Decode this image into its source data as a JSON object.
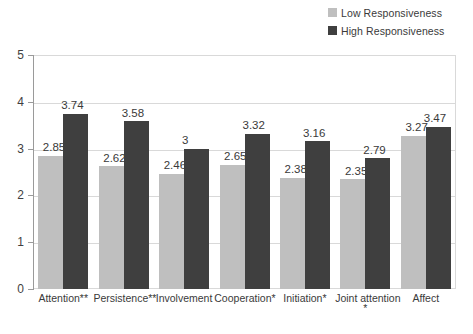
{
  "chart_data": {
    "type": "bar",
    "title": "",
    "xlabel": "",
    "ylabel": "",
    "ylim": [
      0,
      5
    ],
    "yticks": [
      0,
      1,
      2,
      3,
      4,
      5
    ],
    "grid": true,
    "legend_position": "top-right",
    "categories": [
      "Attention**",
      "Persistence**",
      "Involvement",
      "Cooperation*",
      "Initiation*",
      "Joint attention",
      "Affect"
    ],
    "category_sub_marks": [
      "",
      "",
      "",
      "",
      "",
      "*",
      ""
    ],
    "series": [
      {
        "name": "Low Responsiveness",
        "color": "#bfbfbf",
        "values": [
          2.85,
          2.62,
          2.46,
          2.65,
          2.38,
          2.35,
          3.27
        ],
        "labels": [
          "2.85",
          "2.62",
          "2.46",
          "2.65",
          "2.38",
          "2.35",
          "3.27"
        ]
      },
      {
        "name": "High Responsiveness",
        "color": "#3f3f3f",
        "values": [
          3.74,
          3.58,
          3.0,
          3.32,
          3.16,
          2.79,
          3.47
        ],
        "labels": [
          "3.74",
          "3.58",
          "3",
          "3.32",
          "3.16",
          "2.79",
          "3.47"
        ]
      }
    ]
  },
  "legend": {
    "items": [
      {
        "label": "Low Responsiveness",
        "color": "#bfbfbf"
      },
      {
        "label": "High Responsiveness",
        "color": "#3f3f3f"
      }
    ]
  },
  "axis": {
    "y_tick_labels": [
      "5",
      "4",
      "3",
      "2",
      "1",
      "0"
    ]
  }
}
